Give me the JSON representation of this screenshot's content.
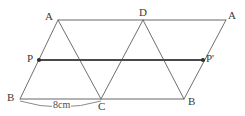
{
  "figure": {
    "colors": {
      "background": "#ffffff",
      "horizontal_rail": "#9a9a9a",
      "diagonal_edge": "#6f6f6f",
      "translation_vector": "#4a4a4a",
      "arc": "#8a8a8a",
      "label_text": "#3a3a3a"
    },
    "vertex_labels": [
      {
        "name": "A-top-left",
        "text": "A",
        "x": 45,
        "y": 11
      },
      {
        "name": "D-top-mid",
        "text": "D",
        "x": 139,
        "y": 7
      },
      {
        "name": "A-top-right",
        "text": "A",
        "x": 228,
        "y": 10
      },
      {
        "name": "P-mid-left",
        "text": "P",
        "x": 27,
        "y": 53
      },
      {
        "name": "P-mid-right",
        "text": "P'",
        "x": 206,
        "y": 53
      },
      {
        "name": "B-bot-left",
        "text": "B",
        "x": 7,
        "y": 92
      },
      {
        "name": "C-bot-mid",
        "text": "C",
        "x": 98,
        "y": 101
      },
      {
        "name": "B-bot-right",
        "text": "B",
        "x": 188,
        "y": 96
      }
    ],
    "measurement": {
      "text": "8cm",
      "x": 52,
      "y": 100,
      "from": "B",
      "to": "C"
    },
    "points": {
      "A_left": {
        "x": 58,
        "y": 20
      },
      "D": {
        "x": 143,
        "y": 20
      },
      "A_right": {
        "x": 226,
        "y": 20
      },
      "P": {
        "x": 39,
        "y": 60
      },
      "P_prime": {
        "x": 203,
        "y": 60
      },
      "B_left": {
        "x": 20,
        "y": 99
      },
      "C": {
        "x": 101,
        "y": 99
      },
      "B_right": {
        "x": 184,
        "y": 99
      }
    },
    "geometry": {
      "top_rail": {
        "x1": 58,
        "y1": 20,
        "x2": 226,
        "y2": 20
      },
      "middle_rail": {
        "x1": 39,
        "y1": 60,
        "x2": 203,
        "y2": 60
      },
      "bottom_rail": {
        "x1": 20,
        "y1": 99,
        "x2": 184,
        "y2": 99
      },
      "diagonals": [
        {
          "name": "B-left-to-A-left",
          "x1": 20,
          "y1": 99,
          "x2": 58,
          "y2": 20
        },
        {
          "name": "A-left-to-C",
          "x1": 58,
          "y1": 20,
          "x2": 101,
          "y2": 99
        },
        {
          "name": "C-to-D",
          "x1": 101,
          "y1": 99,
          "x2": 143,
          "y2": 20
        },
        {
          "name": "D-to-B-right",
          "x1": 143,
          "y1": 20,
          "x2": 184,
          "y2": 99
        },
        {
          "name": "B-right-to-A-right",
          "x1": 184,
          "y1": 99,
          "x2": 226,
          "y2": 20
        }
      ],
      "arc": {
        "start_x": 20,
        "start_y": 102,
        "end_x": 101,
        "end_y": 102,
        "sag": 11
      },
      "dots": [
        {
          "name": "dot-P",
          "x": 39,
          "y": 60,
          "r": 2.1
        },
        {
          "name": "dot-P-prime",
          "x": 203,
          "y": 60,
          "r": 2.1
        }
      ]
    }
  }
}
